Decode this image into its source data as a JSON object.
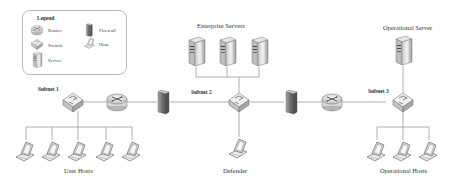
{
  "legend": {
    "title": "Legend",
    "items": [
      {
        "icon": "router-icon",
        "label": "Router"
      },
      {
        "icon": "switch-icon",
        "label": "Switch"
      },
      {
        "icon": "server-icon",
        "label": "Server"
      },
      {
        "icon": "firewall-icon",
        "label": "Firewall"
      },
      {
        "icon": "host-icon",
        "label": "Host"
      }
    ]
  },
  "groups": {
    "enterprise_servers": "Enterprise Servers",
    "operational_server": "Operational Server",
    "user_hosts": "User Hosts",
    "defender": "Defender",
    "operational_hosts": "Operational Hosts"
  },
  "subnets": {
    "subnet1": "Subnet 1",
    "subnet2": "Subnet 2",
    "subnet3": "Subnet 3"
  },
  "colors": {
    "line": "#9a9a9a",
    "device_light": "#eeeeee",
    "device_dark": "#8a8a8a",
    "firewall": "#7d7d7d"
  }
}
